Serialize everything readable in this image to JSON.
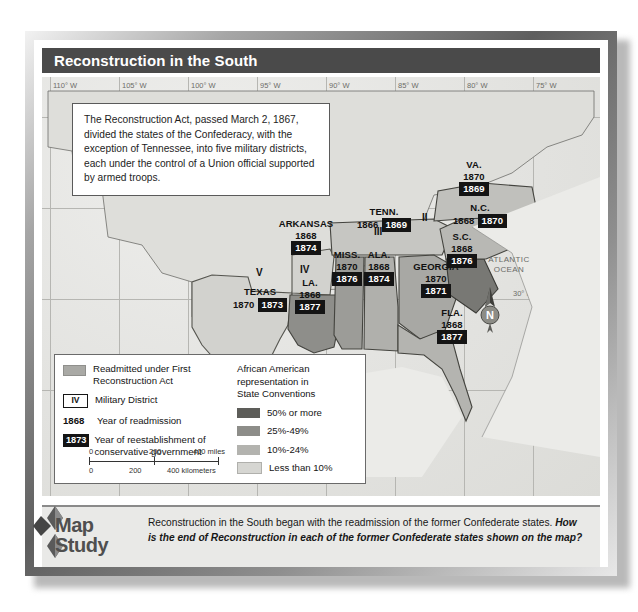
{
  "title": "Reconstruction in the South",
  "callout": {
    "text": "The Reconstruction Act, passed March 2, 1867, divided the states of the Confederacy, with the exception of Tennessee, into five military districts, each under the control of a Union official supported by armed troops."
  },
  "graticule": {
    "longitude": [
      "110° W",
      "105° W",
      "100° W",
      "95° W",
      "90° W",
      "85° W",
      "80° W",
      "75° W"
    ],
    "latitude": [
      "40° N",
      "35° N",
      "30° N",
      "25° N"
    ]
  },
  "ocean_label": "ATLANTIC\nOCEAN",
  "compass": {
    "letter": "N"
  },
  "states": [
    {
      "id": "texas",
      "name": "TEXAS",
      "readmission": "1870",
      "conservative": "1873",
      "district": "V",
      "shade": "#d2d2ce",
      "inline": true
    },
    {
      "id": "arkansas",
      "name": "ARKANSAS",
      "readmission": "1868",
      "conservative": "1874",
      "district": "IV",
      "shade": "#d2d2ce",
      "inline": false
    },
    {
      "id": "louisiana",
      "name": "LA.",
      "readmission": "1868",
      "conservative": "1877",
      "district": "",
      "shade": "#8e8e8a",
      "inline": false
    },
    {
      "id": "mississippi",
      "name": "MISS.",
      "readmission": "1870",
      "conservative": "1876",
      "district": "",
      "shade": "#9c9c98",
      "inline": false
    },
    {
      "id": "alabama",
      "name": "ALA.",
      "readmission": "1868",
      "conservative": "1874",
      "district": "III",
      "shade": "#b0b0ac",
      "inline": false
    },
    {
      "id": "tennessee",
      "name": "TENN.",
      "readmission": "1866",
      "conservative": "1869",
      "district": "",
      "shade": "#c6c6c2",
      "inline": true
    },
    {
      "id": "georgia",
      "name": "GEORGIA",
      "readmission": "1870",
      "conservative": "1871",
      "district": "",
      "shade": "#a8a8a4",
      "inline": false
    },
    {
      "id": "florida",
      "name": "FLA.",
      "readmission": "1868",
      "conservative": "1877",
      "district": "",
      "shade": "#b4b4b0",
      "inline": false
    },
    {
      "id": "southcarolina",
      "name": "S.C.",
      "readmission": "1868",
      "conservative": "1876",
      "district": "",
      "shade": "#787874",
      "inline": false
    },
    {
      "id": "northcarolina",
      "name": "N.C.",
      "readmission": "1868",
      "conservative": "1870",
      "district": "II",
      "shade": "#b8b8b4",
      "inline": true
    },
    {
      "id": "virginia",
      "name": "VA.",
      "readmission": "1870",
      "conservative": "1869",
      "district": "",
      "shade": "#c0c0bc",
      "inline": false
    }
  ],
  "legend": {
    "readmitted_label": "Readmitted under First\nReconstruction Act",
    "readmitted_swatch": "#a9a9a5",
    "military_district_box": "IV",
    "military_district_label": "Military District",
    "year_readmission_example": "1868",
    "year_readmission_label": "Year of readmission",
    "year_conservative_example": "1873",
    "year_conservative_label": "Year of reestablishment of\nconservative government",
    "representation_heading": "African American\nrepresentation in\nState Conventions",
    "representation_items": [
      {
        "label": "50% or more",
        "color": "#5d5d59"
      },
      {
        "label": "25%-49%",
        "color": "#8d8d89"
      },
      {
        "label": "10%-24%",
        "color": "#b3b3af"
      },
      {
        "label": "Less than 10%",
        "color": "#d6d6d2"
      }
    ],
    "scale": {
      "miles": {
        "ticks": [
          "0",
          "200",
          "400 miles"
        ]
      },
      "kilometers": {
        "ticks": [
          "0",
          "200",
          "400 kilometers"
        ]
      }
    }
  },
  "map_study": {
    "line1": "Map",
    "line2": "Study"
  },
  "caption": {
    "lead": "Reconstruction in the South began with the readmission of the former Confederate states.",
    "question": "How is the end of Reconstruction in each of the former Confederate states shown on the map?"
  }
}
